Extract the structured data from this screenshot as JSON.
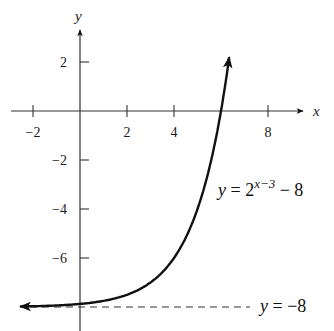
{
  "chart_data": {
    "type": "line",
    "title": "",
    "xlabel": "x",
    "ylabel": "y",
    "xlim": [
      -2.5,
      9.5
    ],
    "ylim": [
      -8.3,
      3.1
    ],
    "grid": false,
    "x_ticks": [
      -2,
      2,
      4,
      8
    ],
    "y_ticks": [
      2,
      -2,
      -4,
      -6
    ],
    "x_tick_labels": [
      "−2",
      "2",
      "4",
      "8"
    ],
    "y_tick_labels": [
      "2",
      "−2",
      "−4",
      "−6"
    ],
    "series": [
      {
        "name": "y = 2^(x−3) − 8",
        "function": "2^(x-3) - 8",
        "x": [
          -2.5,
          -2,
          -1,
          0,
          1,
          2,
          3,
          4,
          5,
          5.5,
          6,
          6.3,
          6.4
        ],
        "values": [
          -7.98,
          -7.97,
          -7.94,
          -7.88,
          -7.75,
          -7.5,
          -7,
          -6,
          -4,
          -2.34,
          0,
          1.85,
          2.56
        ],
        "style": "solid",
        "arrows": "both"
      },
      {
        "name": "y = −8",
        "function": "-8",
        "x": [
          -2.5,
          7
        ],
        "values": [
          -8,
          -8
        ],
        "style": "dashed"
      }
    ],
    "annotations": [
      {
        "text_parts": {
          "lhs": "y",
          "eq": " = 2",
          "exp": "x−3",
          "tail": " − 8"
        },
        "x": 5.9,
        "y": -3.5
      },
      {
        "text_parts": {
          "lhs": "y",
          "eq": " = −8"
        },
        "x": 7.5,
        "y": -8
      }
    ]
  },
  "layout": {
    "origin_px": [
      80,
      111
    ],
    "x_scale": 23.5,
    "y_scale": 24.5
  }
}
